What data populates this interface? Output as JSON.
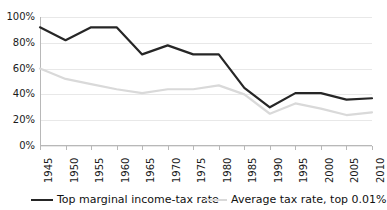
{
  "chart_data": {
    "type": "line",
    "title": "",
    "xlabel": "",
    "ylabel": "",
    "ylim": [
      0,
      100
    ],
    "ytick_labels": [
      "100%",
      "80%",
      "60%",
      "40%",
      "20%",
      "0%"
    ],
    "ytick_values": [
      100,
      80,
      60,
      40,
      20,
      0
    ],
    "grid": true,
    "legend_position": "bottom",
    "categories": [
      "1945",
      "1950",
      "1955",
      "1960",
      "1965",
      "1970",
      "1975",
      "1980",
      "1985",
      "1990",
      "1995",
      "2000",
      "2005",
      "2010"
    ],
    "x": [
      1945,
      1950,
      1955,
      1960,
      1965,
      1970,
      1975,
      1980,
      1985,
      1990,
      1995,
      2000,
      2005,
      2010
    ],
    "series": [
      {
        "name": "Top marginal income-tax rate",
        "color": "#262626",
        "width": 2.2,
        "values": [
          92,
          82,
          92,
          92,
          71,
          78,
          71,
          71,
          45,
          30,
          41,
          41,
          36,
          37
        ]
      },
      {
        "name": "Average tax rate, top 0.01%",
        "color": "#d9d9d9",
        "width": 2.2,
        "values": [
          60,
          52,
          48,
          44,
          41,
          44,
          44,
          47,
          40,
          25,
          33,
          29,
          24,
          26
        ]
      }
    ]
  },
  "legend": {
    "items": [
      {
        "label": "Top marginal income-tax rate",
        "color": "#262626"
      },
      {
        "label": "Average tax rate, top 0.01%",
        "color": "#d9d9d9"
      }
    ]
  },
  "axes": {
    "y": {
      "ticks": [
        "100%",
        "80%",
        "60%",
        "40%",
        "20%",
        "0%"
      ]
    },
    "x": {
      "ticks": [
        "1945",
        "1950",
        "1955",
        "1960",
        "1965",
        "1970",
        "1975",
        "1980",
        "1985",
        "1990",
        "1995",
        "2000",
        "2005",
        "2010"
      ]
    }
  }
}
